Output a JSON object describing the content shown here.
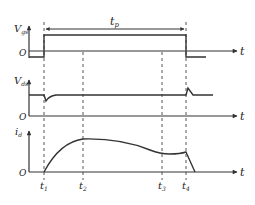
{
  "diagram": {
    "type": "timing-diagram",
    "panels": [
      {
        "id": "vgs",
        "y_label": "V",
        "y_sub": "gs",
        "origin_label": "O",
        "x_label": "t"
      },
      {
        "id": "vds",
        "y_label": "V",
        "y_sub": "ds",
        "origin_label": "O",
        "x_label": "t"
      },
      {
        "id": "id",
        "y_label": "i",
        "y_sub": "d",
        "origin_label": "O",
        "x_label": "t"
      }
    ],
    "pulse_width_label": {
      "main": "t",
      "sub": "p"
    },
    "time_markers": [
      {
        "main": "t",
        "sub": "1"
      },
      {
        "main": "t",
        "sub": "2"
      },
      {
        "main": "t",
        "sub": "3"
      },
      {
        "main": "t",
        "sub": "4"
      }
    ],
    "colors": {
      "line": "#333333",
      "dashed": "#555555",
      "background": "#ffffff"
    }
  }
}
